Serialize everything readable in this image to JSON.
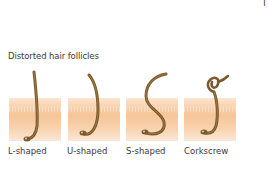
{
  "corner_text": "T",
  "title": "Distorted hair follicles",
  "colors": {
    "hair": "#7a5a2e",
    "hair_dark": "#5a3f1c",
    "skin_light": "#fbe6d2",
    "skin_mid": "#f6c598",
    "text": "#3a3a3a"
  },
  "follicles": [
    {
      "label": "L-shaped",
      "shape": "l-shaped-hair-icon"
    },
    {
      "label": "U-shaped",
      "shape": "u-shaped-hair-icon"
    },
    {
      "label": "S-shaped",
      "shape": "s-shaped-hair-icon"
    },
    {
      "label": "Corkscrew",
      "shape": "corkscrew-hair-icon"
    }
  ]
}
